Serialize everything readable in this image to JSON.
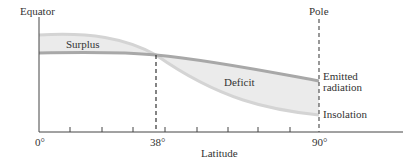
{
  "diagram": {
    "title_left": "Equator",
    "title_right": "Pole",
    "regions": {
      "surplus": "Surplus",
      "deficit": "Deficit"
    },
    "curves": {
      "emitted_line1": "Emitted",
      "emitted_line2": "radiation",
      "insolation": "Insolation"
    },
    "x_axis": {
      "label": "Latitude",
      "ticks": [
        "0°",
        "38°",
        "90°"
      ]
    },
    "colors": {
      "fill": "#ebebeb",
      "curve_emitted": "#a8a8a8",
      "curve_insolation": "#d4d4d4",
      "axis": "#444444"
    }
  }
}
